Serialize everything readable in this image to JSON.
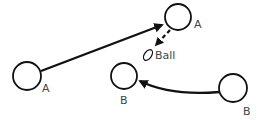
{
  "diagram": {
    "players": [
      {
        "id": "a1",
        "label": "A",
        "cx": 27,
        "cy": 76,
        "r": 14,
        "lx": 42,
        "ly": 92
      },
      {
        "id": "a2",
        "label": "A",
        "cx": 178,
        "cy": 17,
        "r": 13,
        "lx": 194,
        "ly": 28
      },
      {
        "id": "b1",
        "label": "B",
        "cx": 124,
        "cy": 76,
        "r": 13,
        "lx": 120,
        "ly": 104
      },
      {
        "id": "b2",
        "label": "B",
        "cx": 233,
        "cy": 88,
        "r": 14,
        "lx": 243,
        "ly": 115
      }
    ],
    "ball": {
      "label": "Ball",
      "cx": 148,
      "cy": 54
    },
    "arrows": [
      {
        "type": "pass",
        "style": "solid",
        "from": "A (left)",
        "to": "A (top)"
      },
      {
        "type": "ball-drop",
        "style": "dashed",
        "from": "A (top)",
        "to": "Ball"
      },
      {
        "type": "run",
        "style": "solid-curved",
        "from": "B (right)",
        "to": "B (middle)"
      }
    ],
    "colors": {
      "stroke": "#111111",
      "label": "#444444"
    }
  }
}
